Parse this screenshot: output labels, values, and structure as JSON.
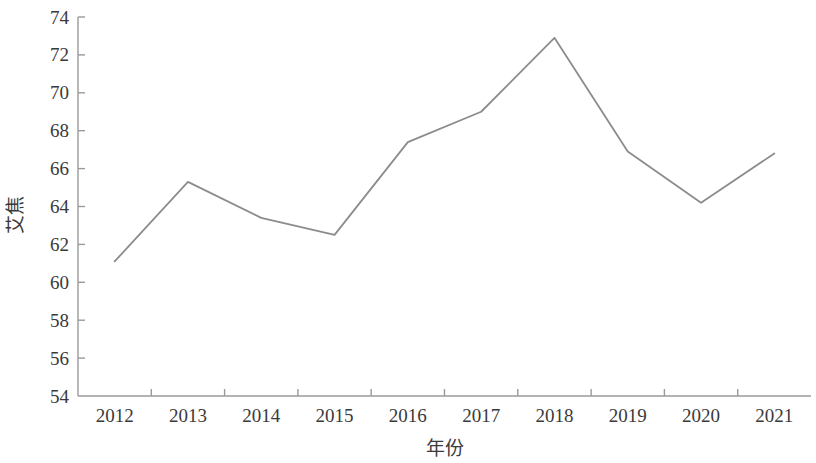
{
  "chart_data": {
    "type": "line",
    "title": "",
    "subtitle": "",
    "xlabel": "年份",
    "ylabel": "艾焦",
    "categories": [
      "2012",
      "2013",
      "2014",
      "2015",
      "2016",
      "2017",
      "2018",
      "2019",
      "2020",
      "2021"
    ],
    "x": [
      2012,
      2013,
      2014,
      2015,
      2016,
      2017,
      2018,
      2019,
      2020,
      2021
    ],
    "values": [
      61.1,
      65.3,
      63.4,
      62.5,
      67.4,
      69.0,
      72.9,
      66.9,
      64.2,
      66.8
    ],
    "series": [
      {
        "name": "",
        "values": [
          61.1,
          65.3,
          63.4,
          62.5,
          67.4,
          69.0,
          72.9,
          66.9,
          64.2,
          66.8
        ],
        "color": "#8c8c8c"
      }
    ],
    "ylim": [
      54,
      74
    ],
    "ytick_labels": [
      "54",
      "56",
      "58",
      "60",
      "62",
      "64",
      "66",
      "68",
      "70",
      "72",
      "74"
    ],
    "yticks": [
      54,
      56,
      58,
      60,
      62,
      64,
      66,
      68,
      70,
      72,
      74
    ],
    "xtick_labels": [
      "2012",
      "2013",
      "2014",
      "2015",
      "2016",
      "2017",
      "2018",
      "2019",
      "2020",
      "2021"
    ],
    "grid": false,
    "legend": false,
    "legend_position": "none",
    "line_color": "#8c8c8c",
    "axis_color": "#9a9a9a",
    "background_color": "#ffffff",
    "markers": false,
    "annotations": []
  },
  "axis": {
    "y_title": "艾焦",
    "x_title": "年份"
  }
}
